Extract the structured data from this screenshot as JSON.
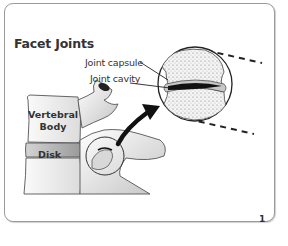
{
  "figure": {
    "title": "Facet Joints",
    "page_number": "1",
    "labels": {
      "joint_capsule": "Joint capsule",
      "joint_cavity": "Joint cavity",
      "vertebral_body": "Vertebral Body",
      "disk": "Disk"
    },
    "colors": {
      "border": "#9a9a9a",
      "text": "#333333",
      "line": "#222222",
      "bone_light": "#f2f2f2",
      "bone_shade": "#bdbdbd",
      "disk_fill": "#b0b0b0",
      "cavity": "#1a1a1a"
    }
  }
}
